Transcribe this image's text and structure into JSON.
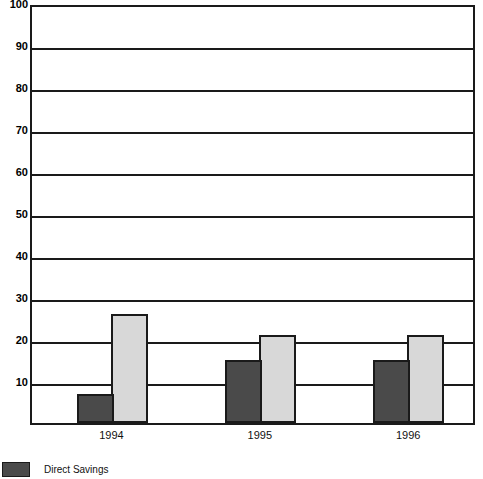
{
  "chart_data": {
    "type": "bar",
    "title": "",
    "xlabel": "",
    "ylabel": "",
    "categories": [
      "1994",
      "1995",
      "1996"
    ],
    "series": [
      {
        "name": "Direct Savings",
        "color": "#4a4a4a",
        "values": [
          7,
          15,
          15
        ]
      },
      {
        "name": "",
        "color": "#d8d8d8",
        "values": [
          26,
          21,
          21
        ]
      }
    ],
    "ylim": [
      0,
      100
    ],
    "yticks": [
      10,
      20,
      30,
      40,
      50,
      60,
      70,
      80,
      90,
      100
    ],
    "ytick_labels": [
      "10",
      "20",
      "30",
      "40",
      "50",
      "60",
      "70",
      "80",
      "90",
      "100"
    ],
    "grid": true,
    "grid_axis": "y",
    "legend_position": "bottom-left",
    "legend": [
      {
        "label": "Direct Savings",
        "color": "#4a4a4a"
      }
    ]
  },
  "colors": {
    "axis": "#1a1a1a",
    "grid": "#1a1a1a",
    "background": "#ffffff",
    "series_dark": "#4a4a4a",
    "series_light": "#d8d8d8"
  }
}
